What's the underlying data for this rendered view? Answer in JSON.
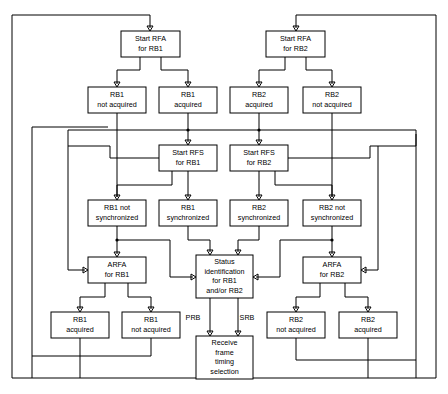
{
  "diagram": {
    "type": "flowchart",
    "canvas": {
      "width": 448,
      "height": 394
    },
    "colors": {
      "stroke": "#000000",
      "fill": "#ffffff",
      "text": "#000000"
    },
    "nodes": [
      {
        "id": "start_rfa_rb1",
        "lines": [
          "Start RFA",
          "for RB1"
        ],
        "x": 121,
        "y": 31,
        "w": 59,
        "h": 26
      },
      {
        "id": "start_rfa_rb2",
        "lines": [
          "Start RFA",
          "for RB2"
        ],
        "x": 266,
        "y": 31,
        "w": 59,
        "h": 26
      },
      {
        "id": "rb1_not_acquired_top",
        "lines": [
          "RB1",
          "not acquired"
        ],
        "x": 88,
        "y": 87,
        "w": 58,
        "h": 26
      },
      {
        "id": "rb1_acquired_top",
        "lines": [
          "RB1",
          "acquired"
        ],
        "x": 159,
        "y": 87,
        "w": 58,
        "h": 26
      },
      {
        "id": "rb2_acquired_top",
        "lines": [
          "RB2",
          "acquired"
        ],
        "x": 230,
        "y": 87,
        "w": 58,
        "h": 26
      },
      {
        "id": "rb2_not_acquired_top",
        "lines": [
          "RB2",
          "not acquired"
        ],
        "x": 303,
        "y": 87,
        "w": 58,
        "h": 26
      },
      {
        "id": "start_rfs_rb1",
        "lines": [
          "Start RFS",
          "for RB1"
        ],
        "x": 159,
        "y": 145,
        "w": 58,
        "h": 26
      },
      {
        "id": "start_rfs_rb2",
        "lines": [
          "Start RFS",
          "for RB2"
        ],
        "x": 230,
        "y": 145,
        "w": 58,
        "h": 26
      },
      {
        "id": "rb1_not_sync",
        "lines": [
          "RB1 not",
          "synchronized"
        ],
        "x": 88,
        "y": 200,
        "w": 58,
        "h": 26
      },
      {
        "id": "rb1_sync",
        "lines": [
          "RB1",
          "synchronized"
        ],
        "x": 159,
        "y": 200,
        "w": 58,
        "h": 26
      },
      {
        "id": "rb2_sync",
        "lines": [
          "RB2",
          "synchronized"
        ],
        "x": 230,
        "y": 200,
        "w": 58,
        "h": 26
      },
      {
        "id": "rb2_not_sync",
        "lines": [
          "RB2 not",
          "synchronized"
        ],
        "x": 303,
        "y": 200,
        "w": 58,
        "h": 26
      },
      {
        "id": "arfa_rb1",
        "lines": [
          "ARFA",
          "for RB1"
        ],
        "x": 88,
        "y": 257,
        "w": 58,
        "h": 26
      },
      {
        "id": "status_identification",
        "lines": [
          "Status",
          "identification",
          "for RB1",
          "and/or RB2"
        ],
        "x": 196,
        "y": 255,
        "w": 57,
        "h": 43
      },
      {
        "id": "arfa_rb2",
        "lines": [
          "ARFA",
          "for RB2"
        ],
        "x": 303,
        "y": 257,
        "w": 58,
        "h": 26
      },
      {
        "id": "rb1_acquired_bottom",
        "lines": [
          "RB1",
          "acquired"
        ],
        "x": 51,
        "y": 312,
        "w": 58,
        "h": 26
      },
      {
        "id": "rb1_not_acquired_bottom",
        "lines": [
          "RB1",
          "not acquired"
        ],
        "x": 122,
        "y": 312,
        "w": 58,
        "h": 26
      },
      {
        "id": "receive_frame_timing",
        "lines": [
          "Receive",
          "frame",
          "timing",
          "selection"
        ],
        "x": 196,
        "y": 336,
        "w": 57,
        "h": 43
      },
      {
        "id": "rb2_not_acquired_bottom",
        "lines": [
          "RB2",
          "not acquired"
        ],
        "x": 267,
        "y": 312,
        "w": 58,
        "h": 26
      },
      {
        "id": "rb2_acquired_bottom",
        "lines": [
          "RB2",
          "acquired"
        ],
        "x": 339,
        "y": 312,
        "w": 58,
        "h": 26
      }
    ],
    "edge_labels": [
      {
        "id": "prb",
        "text": "PRB",
        "x": 193,
        "y": 320
      },
      {
        "id": "srb",
        "text": "SRB",
        "x": 247,
        "y": 320
      }
    ]
  }
}
